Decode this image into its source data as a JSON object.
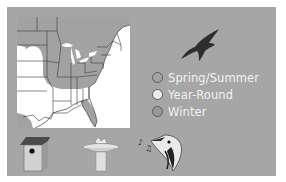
{
  "card": {
    "background_color": "#a6a6a6",
    "map": {
      "region": "Eastern United States",
      "range_color": "#a0a0a0",
      "outside_range_color": "#ffffff"
    },
    "bird_icon": "flying-bird-silhouette-icon",
    "legend": {
      "items": [
        {
          "label": "Spring/Summer",
          "color": "#a4a4a4"
        },
        {
          "label": "Year-Round",
          "color": "#ececec"
        },
        {
          "label": "Winter",
          "color": "#989898"
        }
      ]
    },
    "habitat_icons": [
      {
        "name": "birdhouse-icon"
      },
      {
        "name": "birdbath-icon"
      },
      {
        "name": "bird-song-icon"
      }
    ]
  }
}
